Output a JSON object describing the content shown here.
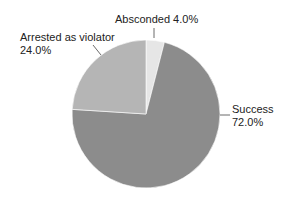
{
  "chart_data": {
    "type": "pie",
    "title": "",
    "slices": [
      {
        "label": "Success",
        "value": 72.0,
        "display": "72.0%",
        "color": "#8c8c8c"
      },
      {
        "label": "Arrested as violator",
        "value": 24.0,
        "display": "24.0%",
        "color": "#b5b5b5"
      },
      {
        "label": "Absconded",
        "value": 4.0,
        "display": "4.0%",
        "color": "#e6e6e6"
      }
    ],
    "start_angle_deg": 0,
    "legend": "none",
    "labels_position": "outside with leader lines"
  },
  "labels": {
    "absconded": "Absconded 4.0%",
    "arrested_line1": "Arrested as violator",
    "arrested_line2": "24.0%",
    "success_line1": "Success",
    "success_line2": "72.0%"
  }
}
